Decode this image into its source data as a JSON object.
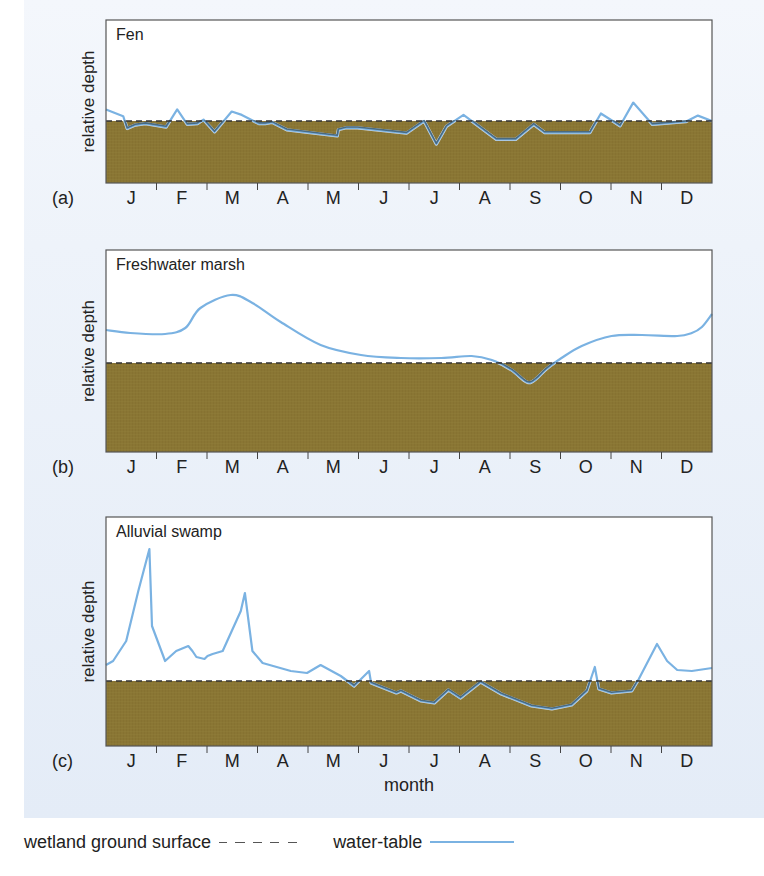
{
  "figure": {
    "background_color": "#e9eff8",
    "ground_color": "#8a7634",
    "water_table_color": "#7ab2e2",
    "submerged_line_color": "#4a6a80",
    "ground_surface_dash_color": "#333333"
  },
  "axis": {
    "xlabel": "month",
    "ylabel": "relative depth",
    "months": [
      "J",
      "F",
      "M",
      "A",
      "M",
      "J",
      "J",
      "A",
      "S",
      "O",
      "N",
      "D"
    ]
  },
  "panels": [
    {
      "id": "a",
      "label": "(a)",
      "title": "Fen"
    },
    {
      "id": "b",
      "label": "(b)",
      "title": "Freshwater marsh"
    },
    {
      "id": "c",
      "label": "(c)",
      "title": "Alluvial swamp"
    }
  ],
  "legend": {
    "ground_surface_label": "wetland ground surface",
    "water_table_label": "water-table"
  },
  "chart_data": [
    {
      "type": "line",
      "title": "Fen",
      "panel_label": "(a)",
      "xlabel": "",
      "ylabel": "relative depth",
      "categories": [
        "J",
        "F",
        "M",
        "A",
        "M",
        "J",
        "J",
        "A",
        "S",
        "O",
        "N",
        "D"
      ],
      "ground_surface_level": 0,
      "grid": false,
      "note": "x in months (0 = start of Jan, 12 = end of Dec); y = water-table relative to ground surface (positive = above ground), arbitrary units",
      "series": [
        {
          "name": "water-table",
          "x": [
            0.0,
            0.34,
            0.42,
            0.58,
            0.78,
            1.19,
            1.41,
            1.61,
            1.81,
            1.93,
            2.15,
            2.49,
            2.69,
            3.03,
            3.15,
            3.29,
            3.58,
            4.58,
            4.6,
            4.76,
            4.98,
            5.95,
            6.3,
            6.54,
            6.74,
            7.08,
            7.73,
            8.11,
            8.47,
            8.69,
            9.58,
            9.8,
            10.18,
            10.44,
            10.82,
            11.48,
            11.72,
            12.0
          ],
          "values": [
            1.7,
            0.7,
            -1.1,
            -0.6,
            -0.4,
            -0.9,
            1.7,
            -0.5,
            -0.4,
            0.2,
            -1.6,
            1.4,
            0.9,
            -0.4,
            -0.4,
            -0.2,
            -1.3,
            -2.2,
            -1.3,
            -1.0,
            -1.0,
            -1.8,
            0.0,
            -3.4,
            -0.8,
            0.9,
            -2.7,
            -2.7,
            -0.5,
            -1.7,
            -1.7,
            1.1,
            -0.7,
            2.7,
            -0.5,
            -0.1,
            0.8,
            0.0
          ]
        }
      ]
    },
    {
      "type": "line",
      "title": "Freshwater marsh",
      "panel_label": "(b)",
      "xlabel": "",
      "ylabel": "relative depth",
      "categories": [
        "J",
        "F",
        "M",
        "A",
        "M",
        "J",
        "J",
        "A",
        "S",
        "O",
        "N",
        "D"
      ],
      "ground_surface_level": 0,
      "grid": false,
      "series": [
        {
          "name": "water-table",
          "x": [
            0.0,
            0.48,
            1.17,
            1.57,
            1.87,
            2.47,
            2.9,
            3.46,
            4.25,
            5.05,
            5.84,
            6.64,
            7.24,
            7.64,
            8.03,
            8.33,
            8.49,
            8.72,
            9.02,
            9.42,
            10.01,
            10.61,
            11.31,
            11.6,
            11.8,
            12.0
          ],
          "values": [
            3.3,
            3.0,
            2.9,
            3.5,
            5.5,
            6.8,
            6.0,
            4.1,
            1.8,
            0.8,
            0.5,
            0.5,
            0.7,
            0.3,
            -0.7,
            -1.9,
            -1.7,
            -0.6,
            0.5,
            1.7,
            2.7,
            2.8,
            2.7,
            3.0,
            3.6,
            4.9
          ]
        }
      ]
    },
    {
      "type": "line",
      "title": "Alluvial swamp",
      "panel_label": "(c)",
      "xlabel": "month",
      "ylabel": "relative depth",
      "categories": [
        "J",
        "F",
        "M",
        "A",
        "M",
        "J",
        "J",
        "A",
        "S",
        "O",
        "N",
        "D"
      ],
      "ground_surface_level": 0,
      "grid": false,
      "series": [
        {
          "name": "water-table",
          "x": [
            0.0,
            0.14,
            0.4,
            0.64,
            0.86,
            0.91,
            1.17,
            1.39,
            1.63,
            1.71,
            1.79,
            1.95,
            2.01,
            2.11,
            2.31,
            2.67,
            2.75,
            2.9,
            3.1,
            3.66,
            3.98,
            4.25,
            4.65,
            4.91,
            5.21,
            5.25,
            5.75,
            5.84,
            6.24,
            6.5,
            6.78,
            7.02,
            7.42,
            7.83,
            8.43,
            8.83,
            9.22,
            9.52,
            9.68,
            9.76,
            10.01,
            10.41,
            10.55,
            10.91,
            11.11,
            11.31,
            11.6,
            12.0
          ],
          "values": [
            1.6,
            2.0,
            4.0,
            9.0,
            13.2,
            5.5,
            2.0,
            3.0,
            3.5,
            3.0,
            2.4,
            2.2,
            2.5,
            2.7,
            3.0,
            7.0,
            8.8,
            3.0,
            1.8,
            1.0,
            0.8,
            1.6,
            0.5,
            -0.5,
            1.0,
            -0.2,
            -1.2,
            -1.0,
            -2.0,
            -2.2,
            -0.9,
            -1.7,
            -0.1,
            -1.3,
            -2.5,
            -2.8,
            -2.4,
            -1.0,
            1.4,
            -0.8,
            -1.2,
            -1.0,
            0.2,
            3.7,
            2.0,
            1.1,
            1.0,
            1.3
          ]
        }
      ]
    }
  ]
}
